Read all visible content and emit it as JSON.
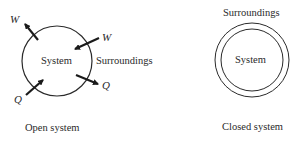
{
  "open_system": {
    "caption": "Open system",
    "system_label": "System",
    "surroundings_label": "Surroundings",
    "work_out_label": "W",
    "work_in_label": "W",
    "heat_in_label": "Q",
    "heat_out_label": "Q"
  },
  "closed_system": {
    "caption": "Closed system",
    "system_label": "System",
    "surroundings_label": "Surroundings"
  },
  "colors": {
    "line": "#2a2a2a",
    "background": "#ffffff"
  }
}
